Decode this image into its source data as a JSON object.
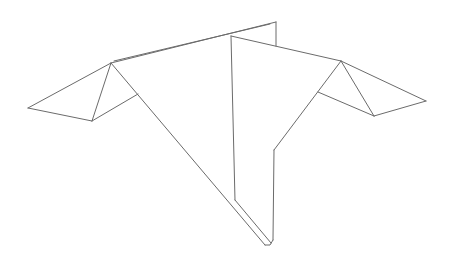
{
  "diagram": {
    "type": "3d-wireframe",
    "background": "#ffffff",
    "stroke_color": "#6b6b6b",
    "stroke_width": 1,
    "segments": [
      {
        "name": "left-wing-top-edge",
        "points": [
          [
            28,
            108
          ],
          [
            111,
            63
          ]
        ]
      },
      {
        "name": "left-wing-bottom-edge",
        "points": [
          [
            28,
            108
          ],
          [
            92,
            121
          ]
        ]
      },
      {
        "name": "left-wing-fold",
        "points": [
          [
            111,
            63
          ],
          [
            92,
            121
          ]
        ]
      },
      {
        "name": "left-wing-inner-edge",
        "points": [
          [
            92,
            121
          ],
          [
            138,
            94
          ]
        ]
      },
      {
        "name": "top-ridge",
        "points": [
          [
            111,
            63
          ],
          [
            276,
            22
          ]
        ]
      },
      {
        "name": "top-ridge-inner",
        "points": [
          [
            114,
            61
          ],
          [
            270,
            24
          ]
        ]
      },
      {
        "name": "back-fin-vertical",
        "points": [
          [
            276,
            22
          ],
          [
            276,
            46
          ]
        ]
      },
      {
        "name": "body-left-diagonal",
        "points": [
          [
            111,
            63
          ],
          [
            265,
            245
          ]
        ]
      },
      {
        "name": "front-fin-top",
        "points": [
          [
            231,
            36
          ],
          [
            341,
            61
          ]
        ]
      },
      {
        "name": "front-fin-vertical",
        "points": [
          [
            231,
            36
          ],
          [
            235,
            200
          ]
        ]
      },
      {
        "name": "front-fin-bottom-diagonal",
        "points": [
          [
            235,
            200
          ],
          [
            271,
            243
          ]
        ]
      },
      {
        "name": "bottom-tip",
        "points": [
          [
            265,
            245
          ],
          [
            270,
            245
          ],
          [
            273,
            240
          ]
        ]
      },
      {
        "name": "body-right-vertical",
        "points": [
          [
            273,
            240
          ],
          [
            274,
            150
          ]
        ]
      },
      {
        "name": "body-right-diagonal",
        "points": [
          [
            274,
            150
          ],
          [
            341,
            61
          ]
        ]
      },
      {
        "name": "right-wing-top-edge",
        "points": [
          [
            341,
            61
          ],
          [
            426,
            101
          ]
        ]
      },
      {
        "name": "right-wing-bottom-edge",
        "points": [
          [
            374,
            116
          ],
          [
            426,
            101
          ]
        ]
      },
      {
        "name": "right-wing-fold",
        "points": [
          [
            341,
            61
          ],
          [
            374,
            116
          ]
        ]
      },
      {
        "name": "right-wing-inner-edge",
        "points": [
          [
            318,
            92
          ],
          [
            374,
            116
          ]
        ]
      }
    ]
  }
}
